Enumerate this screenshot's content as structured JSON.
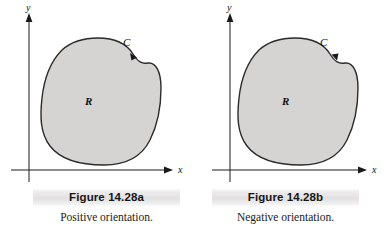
{
  "figures": [
    {
      "id": "figure-a",
      "caption_title": "Figure 14.28a",
      "caption_sub": "Positive orientation.",
      "y_axis_label": "y",
      "x_axis_label": "x",
      "region_label": "R",
      "curve_label": "C",
      "orientation": "counterclockwise",
      "arrow_direction": "left-down",
      "region_fill": "#d6d4d2",
      "curve_stroke": "#2b2b2b",
      "axis_stroke": "#1a1a1a"
    },
    {
      "id": "figure-b",
      "caption_title": "Figure 14.28b",
      "caption_sub": "Negative orientation.",
      "y_axis_label": "y",
      "x_axis_label": "x",
      "region_label": "R",
      "curve_label": "C",
      "orientation": "clockwise",
      "arrow_direction": "right-down",
      "region_fill": "#d6d4d2",
      "curve_stroke": "#2b2b2b",
      "axis_stroke": "#1a1a1a"
    }
  ],
  "colors": {
    "background": "#ffffff",
    "caption_bar": "#e2e0e0",
    "text": "#151515"
  }
}
